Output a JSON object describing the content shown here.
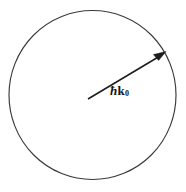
{
  "figure": {
    "kind": "physics-vector-diagram",
    "background_color": "#ffffff",
    "width": 186,
    "height": 192,
    "title": "",
    "circle": {
      "name": "fermi-sphere-outline",
      "center_x": 92.5,
      "center_y": 95,
      "radius_x": 84,
      "radius_y": 85,
      "stroke_color": "#3a3a3a",
      "stroke_width": 1.15,
      "fill": "none"
    },
    "vector": {
      "name": "wavevector-arrow",
      "start_x": 88,
      "start_y": 99,
      "end_x": 165,
      "end_y": 53,
      "stroke_color": "#1c1c1c",
      "stroke_width": 1.5,
      "arrowhead": "filled-triangle",
      "label": {
        "hbar": "ħ",
        "symbol": "k",
        "subscript": "0",
        "full_text": "ħk₀",
        "color": "#141414",
        "x": 110,
        "y": 84
      }
    }
  }
}
